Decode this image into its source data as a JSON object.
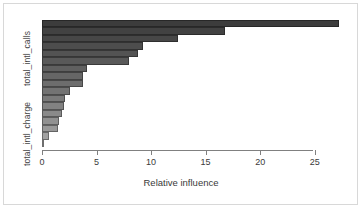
{
  "chart_data": {
    "type": "bar",
    "orientation": "horizontal",
    "title": "",
    "xlabel": "Relative influence",
    "ylabel": "",
    "xlim": [
      0,
      27.5
    ],
    "xticks": [
      0,
      5,
      10,
      15,
      20,
      25
    ],
    "xticklabels": [
      "0",
      "5",
      "10",
      "15",
      "20",
      "25"
    ],
    "grid": false,
    "legend": null,
    "y_axis_labels": [
      "total_intl_calls",
      "total_intl_charge"
    ],
    "categories": [
      "total_intl_calls",
      "bar_2",
      "bar_3",
      "bar_4",
      "bar_5",
      "bar_6",
      "bar_7",
      "bar_8",
      "bar_9",
      "bar_10",
      "bar_11",
      "bar_12",
      "bar_13",
      "bar_14",
      "bar_15",
      "total_intl_charge",
      "bar_17"
    ],
    "values": [
      27.2,
      16.8,
      12.5,
      9.3,
      8.8,
      8.0,
      4.1,
      3.8,
      3.8,
      2.6,
      2.1,
      2.0,
      1.8,
      1.6,
      1.5,
      0.6,
      0.15
    ],
    "bar_colors": [
      "#3c3c3c",
      "#424242",
      "#474747",
      "#4d4d4d",
      "#535353",
      "#595959",
      "#606060",
      "#666666",
      "#6d6d6d",
      "#737373",
      "#7a7a7a",
      "#828282",
      "#8a8a8a",
      "#919191",
      "#999999",
      "#a1a1a1",
      "#a9a9a9"
    ]
  },
  "axis": {
    "xlabel": "Relative influence",
    "ylabel_top": "total_intl_calls",
    "ylabel_bottom": "total_intl_charge",
    "tick_0": "0",
    "tick_1": "5",
    "tick_2": "10",
    "tick_3": "15",
    "tick_4": "20",
    "tick_5": "25"
  },
  "colors": {
    "background": "#ffffff",
    "frame": "#d8d8d8",
    "axis": "#808080",
    "text": "#3a3a3a"
  }
}
